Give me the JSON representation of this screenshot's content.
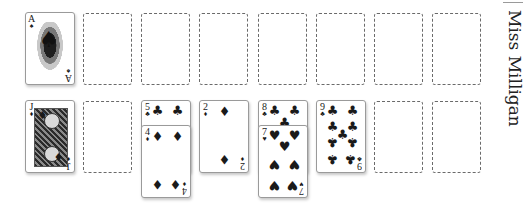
{
  "game": {
    "title": "Miss Milligan"
  },
  "foundations": [
    {
      "occupied": true,
      "rank": "A",
      "suit": "♠",
      "suit_name": "spades",
      "label": "Ace of Spades"
    },
    {
      "occupied": false
    },
    {
      "occupied": false
    },
    {
      "occupied": false
    },
    {
      "occupied": false
    },
    {
      "occupied": false
    },
    {
      "occupied": false
    },
    {
      "occupied": false
    }
  ],
  "tableau": [
    {
      "cards": [
        {
          "rank": "J",
          "suit": "♦",
          "suit_name": "diamonds",
          "label": "Jack of Diamonds"
        }
      ]
    },
    {
      "cards": []
    },
    {
      "cards": [
        {
          "rank": "5",
          "suit": "♣",
          "suit_name": "clubs",
          "label": "Five of Clubs"
        },
        {
          "rank": "4",
          "suit": "♦",
          "suit_name": "diamonds",
          "label": "Four of Diamonds"
        }
      ]
    },
    {
      "cards": [
        {
          "rank": "2",
          "suit": "♦",
          "suit_name": "diamonds",
          "label": "Two of Diamonds"
        }
      ]
    },
    {
      "cards": [
        {
          "rank": "8",
          "suit": "♣",
          "suit_name": "clubs",
          "label": "Eight of Clubs"
        },
        {
          "rank": "7",
          "suit": "♥",
          "suit_name": "hearts",
          "label": "Seven of Hearts"
        }
      ]
    },
    {
      "cards": [
        {
          "rank": "9",
          "suit": "♣",
          "suit_name": "clubs",
          "label": "Nine of Clubs"
        }
      ]
    },
    {
      "cards": []
    },
    {
      "cards": []
    }
  ],
  "colors": {
    "background": "#ffffff",
    "card_border": "#9a9a9a",
    "slot_border": "#6a6a6a",
    "ink": "#1a1a1a"
  }
}
